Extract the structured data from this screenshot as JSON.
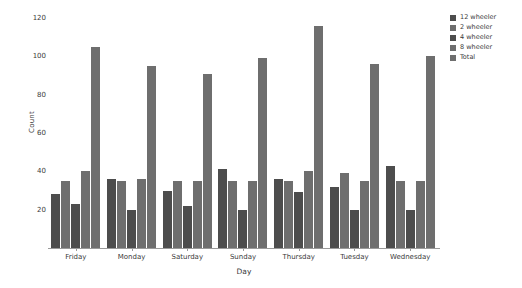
{
  "chart_data": {
    "type": "bar",
    "title": "",
    "xlabel": "Day",
    "ylabel": "Count",
    "ylim": [
      0,
      120
    ],
    "yticks": [
      0,
      20,
      40,
      60,
      80,
      100,
      120
    ],
    "ytick_labels": [
      "",
      "20",
      "40",
      "60",
      "80",
      "100",
      "120"
    ],
    "grid": false,
    "legend_position": "right",
    "categories": [
      "Friday",
      "Monday",
      "Saturday",
      "Sunday",
      "Thursday",
      "Tuesday",
      "Wednesday"
    ],
    "series": [
      {
        "name": "12 wheeler",
        "color": "#4d4d4d",
        "values": [
          28,
          36,
          30,
          41,
          36,
          32,
          43
        ]
      },
      {
        "name": "2 wheeler",
        "color": "#6e6e6e",
        "values": [
          35,
          35,
          35,
          35,
          35,
          39,
          35
        ]
      },
      {
        "name": "4 wheeler",
        "color": "#4d4d4d",
        "values": [
          23,
          20,
          22,
          20,
          29,
          20,
          20
        ]
      },
      {
        "name": "8 wheeler",
        "color": "#6e6e6e",
        "values": [
          40,
          36,
          35,
          35,
          40,
          35,
          35
        ]
      },
      {
        "name": "Total",
        "color": "#6e6e6e",
        "values": [
          105,
          95,
          91,
          99,
          116,
          96,
          100
        ]
      }
    ]
  },
  "legend": {
    "items": [
      {
        "label": "12 wheeler",
        "color": "#4d4d4d"
      },
      {
        "label": "2 wheeler",
        "color": "#6e6e6e"
      },
      {
        "label": "4 wheeler",
        "color": "#4d4d4d"
      },
      {
        "label": "8 wheeler",
        "color": "#6e6e6e"
      },
      {
        "label": "Total",
        "color": "#6e6e6e"
      }
    ]
  },
  "axes": {
    "x_title": "Day",
    "y_title": "Count"
  }
}
